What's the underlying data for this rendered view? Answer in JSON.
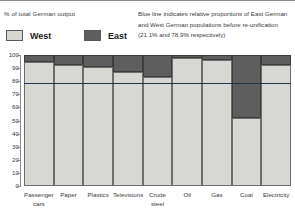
{
  "subtitle": "% of total German output",
  "note": {
    "line1": "Blue line indicates relative proportions of East German",
    "line2": "and West German populations before re-unification",
    "line3": "(21.1% and 78.9% respectively)"
  },
  "legend": {
    "west_label": "West",
    "east_label": "East",
    "west_color": "#d7d7d3",
    "east_color": "#5e5e5e"
  },
  "colors": {
    "reference_line": "#23324f",
    "axis": "#6d6d6d",
    "text": "#3a3a3a"
  },
  "chart_data": {
    "type": "bar",
    "stacked": true,
    "title": "",
    "subtitle": "% of total German output",
    "xlabel": "",
    "ylabel": "% of total German output",
    "ylim": [
      0,
      100
    ],
    "yticks": [
      0,
      10,
      20,
      30,
      40,
      50,
      60,
      70,
      80,
      90,
      100
    ],
    "grid": false,
    "legend_position": "top-left",
    "categories": [
      "Passenger cars",
      "Paper",
      "Plastics",
      "Televisions",
      "Crude steel",
      "Oil",
      "Gas",
      "Coal",
      "Electricity"
    ],
    "series": [
      {
        "name": "West",
        "color": "#d7d7d3",
        "values": [
          95,
          92,
          91,
          87,
          83,
          98,
          96,
          52,
          92
        ]
      },
      {
        "name": "East",
        "color": "#5e5e5e",
        "values": [
          5,
          8,
          9,
          13,
          17,
          2,
          4,
          48,
          8
        ]
      }
    ],
    "annotations": [
      {
        "type": "hline",
        "value": 78.9,
        "color": "#23324f",
        "label": "Blue line indicates relative proportions of East German and West German populations before re-unification (21.1% and 78.9% respectively)"
      }
    ]
  }
}
